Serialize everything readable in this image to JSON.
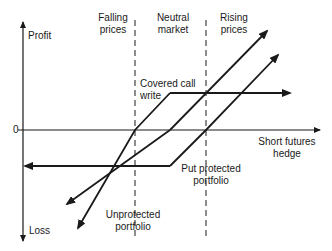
{
  "diagram": {
    "axes": {
      "y_top_label": "Profit",
      "y_bottom_label": "Loss",
      "origin_label": "0",
      "x_label_line1": "Short futures",
      "x_label_line2": "hedge"
    },
    "regions": [
      {
        "line1": "Falling",
        "line2": "prices"
      },
      {
        "line1": "Neutral",
        "line2": "market"
      },
      {
        "line1": "Rising",
        "line2": "prices"
      }
    ],
    "series": {
      "covered_call": {
        "line1": "Covered call",
        "line2": "write"
      },
      "put_protected": {
        "line1": "Put protected",
        "line2": "portfolio"
      },
      "unprotected": {
        "line1": "Unprotected",
        "line2": "portfolio"
      }
    },
    "colors": {
      "line": "#1a1a1a",
      "background": "#ffffff"
    }
  }
}
